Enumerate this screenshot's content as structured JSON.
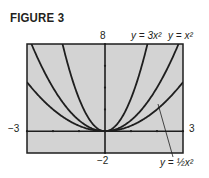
{
  "figure": {
    "title": "FIGURE 3"
  },
  "axis_labels": {
    "ymax": "8",
    "ymin": "−2",
    "xmin": "−3",
    "xmax": "3"
  },
  "curve_labels": {
    "c3": "y = 3x²",
    "c1": "y = x²",
    "chalf": "y = ½x²"
  },
  "colors": {
    "plot_background": "#d3d3d3",
    "curve": "#1e1e1e",
    "frame": "#1e1e1e"
  },
  "chart_data": {
    "type": "line",
    "title": "FIGURE 3",
    "xlabel": "",
    "ylabel": "",
    "xlim": [
      -3,
      3
    ],
    "ylim": [
      -2,
      8
    ],
    "x_ticks_interval": 1,
    "y_ticks_interval": 2,
    "grid": false,
    "legend": "inline labels",
    "x": [
      -3,
      -2.5,
      -2,
      -1.5,
      -1,
      -0.5,
      0,
      0.5,
      1,
      1.5,
      2,
      2.5,
      3
    ],
    "series": [
      {
        "name": "y = 3x^2",
        "values": [
          27,
          18.75,
          12,
          6.75,
          3,
          0.75,
          0,
          0.75,
          3,
          6.75,
          12,
          18.75,
          27
        ]
      },
      {
        "name": "y = x^2",
        "values": [
          9,
          6.25,
          4,
          2.25,
          1,
          0.25,
          0,
          0.25,
          1,
          2.25,
          4,
          6.25,
          9
        ]
      },
      {
        "name": "y = (1/2)x^2",
        "values": [
          4.5,
          3.125,
          2,
          1.125,
          0.5,
          0.125,
          0,
          0.125,
          0.5,
          1.125,
          2,
          3.125,
          4.5
        ]
      }
    ]
  }
}
